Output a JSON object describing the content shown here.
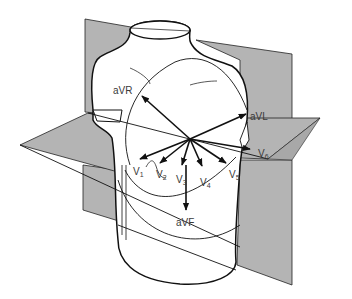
{
  "diagram": {
    "colors": {
      "plane_fill": "#b4b4b4",
      "outline": "#111111",
      "label": "#3a3a3a",
      "background": "#ffffff"
    },
    "planes": [
      {
        "name": "frontal-plane"
      },
      {
        "name": "horizontal-plane"
      }
    ],
    "frontal_leads": [
      {
        "id": "aVR",
        "label": "aVR"
      },
      {
        "id": "aVL",
        "label": "aVL"
      },
      {
        "id": "aVF",
        "label": "aVF"
      }
    ],
    "precordial_leads": [
      {
        "id": "V1",
        "main": "V",
        "sub": "1"
      },
      {
        "id": "V2",
        "main": "V",
        "sub": "2"
      },
      {
        "id": "V3",
        "main": "V",
        "sub": "3"
      },
      {
        "id": "V4",
        "main": "V",
        "sub": "4"
      },
      {
        "id": "V5",
        "main": "V",
        "sub": "5"
      },
      {
        "id": "V6",
        "main": "V",
        "sub": "6"
      }
    ]
  }
}
